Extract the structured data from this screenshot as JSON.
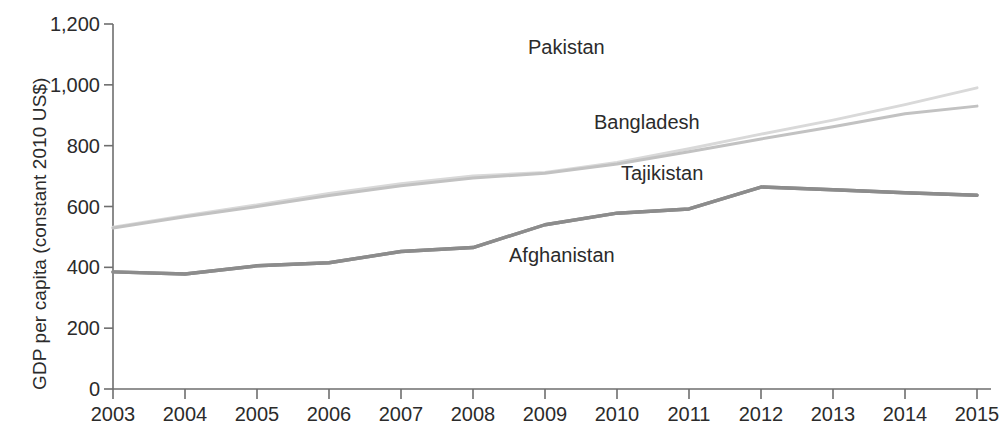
{
  "chart_data": {
    "type": "line",
    "title": "",
    "xlabel": "",
    "ylabel": "GDP per capita (constant 2010 US$)",
    "xlim": [
      2003,
      2015
    ],
    "ylim": [
      0,
      1200
    ],
    "grid": false,
    "legend_position": "inline-annotations",
    "x": [
      2003,
      2004,
      2005,
      2006,
      2007,
      2008,
      2009,
      2010,
      2011,
      2012,
      2013,
      2014,
      2015
    ],
    "series": [
      {
        "name": "Pakistan",
        "color": "#d9d9d9",
        "values": [
          532,
          570,
          605,
          643,
          675,
          700,
          712,
          745,
          790,
          838,
          884,
          935,
          990
        ]
      },
      {
        "name": "Bangladesh",
        "color": "#c2c2c2",
        "values": [
          529,
          566,
          600,
          636,
          668,
          694,
          709,
          740,
          780,
          822,
          862,
          905,
          930
        ]
      },
      {
        "name": "Tajikistan",
        "color": "#8c8c8c",
        "values": [
          385,
          378,
          405,
          415,
          452,
          465,
          540,
          578,
          592,
          664,
          655,
          645,
          637
        ]
      },
      {
        "name": "Afghanistan",
        "color": "#8c8c8c",
        "values": [
          385,
          378,
          405,
          415,
          452,
          465,
          540,
          578,
          592,
          664,
          655,
          645,
          637
        ]
      }
    ],
    "y_ticks": [
      0,
      200,
      400,
      600,
      800,
      1000,
      1200
    ],
    "y_tick_labels": [
      "0",
      "200",
      "400",
      "600",
      "800",
      "1,000",
      "1,200"
    ],
    "x_ticks": [
      2003,
      2004,
      2005,
      2006,
      2007,
      2008,
      2009,
      2010,
      2011,
      2012,
      2013,
      2014,
      2015
    ],
    "x_tick_labels": [
      "2003",
      "2004",
      "2005",
      "2006",
      "2007",
      "2008",
      "2009",
      "2010",
      "2011",
      "2012",
      "2013",
      "2014",
      "2015"
    ],
    "annotations": [
      {
        "text": "Pakistan",
        "x_px": 528,
        "y_px": 36
      },
      {
        "text": "Bangladesh",
        "x_px": 594,
        "y_px": 111
      },
      {
        "text": "Tajikistan",
        "x_px": 621,
        "y_px": 162
      },
      {
        "text": "Afghanistan",
        "x_px": 509,
        "y_px": 244
      }
    ],
    "axis_color": "#6e6e6e"
  }
}
